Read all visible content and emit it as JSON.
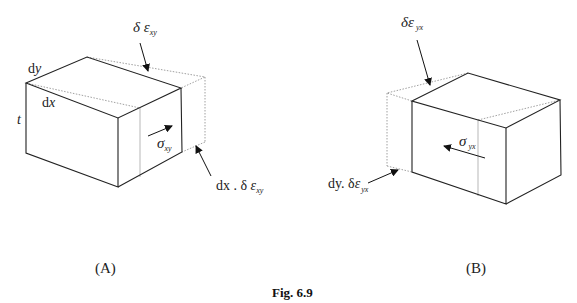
{
  "figure": {
    "caption": "Fig. 6.9",
    "panels": [
      {
        "id": "A",
        "label": "(A)",
        "dimension_labels": {
          "width": "dy",
          "length": "dx",
          "thickness": "t"
        },
        "stress_label": {
          "symbol": "σ",
          "subscript": "xy",
          "direction": "right-up"
        },
        "top_annotation": {
          "prefix": "δ ",
          "symbol": "ε",
          "subscript": "xy"
        },
        "side_annotation": {
          "prefix": "dx . δ ",
          "symbol": "ε",
          "subscript": "xy"
        }
      },
      {
        "id": "B",
        "label": "(B)",
        "stress_label": {
          "symbol": "σ",
          "subscript": "yx",
          "direction": "left-up"
        },
        "top_annotation": {
          "prefix": "δ",
          "symbol": "ε",
          "subscript": "yx"
        },
        "side_annotation": {
          "prefix": "dy. δ",
          "symbol": "ε",
          "subscript": "yx"
        }
      }
    ]
  }
}
